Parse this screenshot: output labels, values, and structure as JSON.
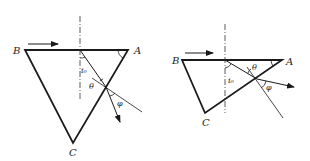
{
  "figures": [
    {
      "id": "left",
      "vertices": {
        "A": {
          "label": "A",
          "x": 128,
          "y": 50
        },
        "B": {
          "label": "B",
          "x": 25,
          "y": 50
        },
        "C": {
          "label": "C",
          "x": 73,
          "y": 143
        }
      },
      "angle_labels": {
        "incidence": "i₀",
        "refraction": "θ",
        "deviation": "φ"
      }
    },
    {
      "id": "right",
      "vertices": {
        "A": {
          "label": "A",
          "x": 282,
          "y": 60
        },
        "B": {
          "label": "B",
          "x": 182,
          "y": 60
        },
        "C": {
          "label": "C",
          "x": 205,
          "y": 113
        }
      },
      "angle_labels": {
        "incidence": "i₀",
        "refraction": "θ",
        "deviation": "φ"
      }
    }
  ],
  "colors": {
    "stroke": "#1a1a1a",
    "label": "#222222"
  }
}
